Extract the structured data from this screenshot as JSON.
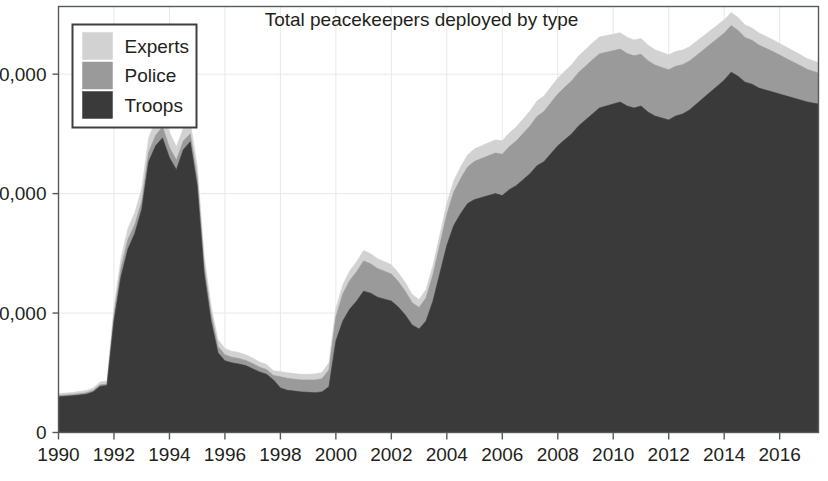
{
  "chart_data": {
    "type": "area",
    "stacked": true,
    "title": "Total peacekeepers deployed by type",
    "xlabel": "",
    "ylabel": "",
    "xlim": [
      1990,
      2017.4
    ],
    "ylim": [
      0,
      107000
    ],
    "grid": true,
    "grid_axes": "both",
    "legend_position": "top-left",
    "y_ticks": [
      0,
      30000,
      60000,
      90000
    ],
    "y_tick_labels": [
      "0",
      "30,000",
      "60,000",
      "90,000"
    ],
    "x_ticks": [
      1990,
      1992,
      1994,
      1996,
      1998,
      2000,
      2002,
      2004,
      2006,
      2008,
      2010,
      2012,
      2014,
      2016
    ],
    "x_tick_labels": [
      "1990",
      "1992",
      "1994",
      "1996",
      "1998",
      "2000",
      "2002",
      "2004",
      "2006",
      "2008",
      "2010",
      "2012",
      "2014",
      "2016"
    ],
    "colors": {
      "Troops": "#3a3a3a",
      "Police": "#9a9a9a",
      "Experts": "#d2d2d2",
      "frame": "#55595c",
      "grid": "#e8e8e8",
      "text": "#231f20",
      "background": "#ffffff"
    },
    "series_order_bottom_to_top": [
      "Troops",
      "Police",
      "Experts"
    ],
    "legend_order_top_to_bottom": [
      "Experts",
      "Police",
      "Troops"
    ],
    "x": [
      1990.0,
      1990.25,
      1990.5,
      1990.75,
      1991.0,
      1991.25,
      1991.5,
      1991.75,
      1992.0,
      1992.25,
      1992.5,
      1992.75,
      1993.0,
      1993.25,
      1993.5,
      1993.75,
      1994.0,
      1994.25,
      1994.5,
      1994.75,
      1995.0,
      1995.25,
      1995.5,
      1995.75,
      1996.0,
      1996.25,
      1996.5,
      1996.75,
      1997.0,
      1997.25,
      1997.5,
      1997.75,
      1998.0,
      1998.25,
      1998.5,
      1998.75,
      1999.0,
      1999.25,
      1999.5,
      1999.75,
      2000.0,
      2000.25,
      2000.5,
      2000.75,
      2001.0,
      2001.25,
      2001.5,
      2001.75,
      2002.0,
      2002.25,
      2002.5,
      2002.75,
      2003.0,
      2003.25,
      2003.5,
      2003.75,
      2004.0,
      2004.25,
      2004.5,
      2004.75,
      2005.0,
      2005.25,
      2005.5,
      2005.75,
      2006.0,
      2006.25,
      2006.5,
      2006.75,
      2007.0,
      2007.25,
      2007.5,
      2007.75,
      2008.0,
      2008.25,
      2008.5,
      2008.75,
      2009.0,
      2009.25,
      2009.5,
      2009.75,
      2010.0,
      2010.25,
      2010.5,
      2010.75,
      2011.0,
      2011.25,
      2011.5,
      2011.75,
      2012.0,
      2012.25,
      2012.5,
      2012.75,
      2013.0,
      2013.25,
      2013.5,
      2013.75,
      2014.0,
      2014.25,
      2014.5,
      2014.75,
      2015.0,
      2015.25,
      2015.5,
      2015.75,
      2016.0,
      2016.25,
      2016.5,
      2016.75,
      2017.0,
      2017.4
    ],
    "series": [
      {
        "name": "Troops",
        "values": [
          9000,
          9100,
          9200,
          9400,
          9600,
          10200,
          11600,
          11800,
          28000,
          39000,
          46000,
          50000,
          56000,
          68000,
          72000,
          74000,
          69000,
          66000,
          71000,
          73000,
          62000,
          40000,
          28000,
          20000,
          18000,
          17500,
          17200,
          16800,
          16000,
          15200,
          14600,
          13200,
          11200,
          10600,
          10400,
          10200,
          10100,
          10000,
          10200,
          11500,
          23000,
          28000,
          31000,
          33000,
          35500,
          35000,
          34000,
          33500,
          33000,
          31500,
          29500,
          27000,
          26000,
          28000,
          33000,
          40000,
          47000,
          52000,
          55000,
          57500,
          58500,
          59000,
          59500,
          60000,
          59500,
          61000,
          62000,
          63500,
          65000,
          67000,
          68000,
          70000,
          72000,
          73500,
          75000,
          77000,
          78500,
          80000,
          81500,
          82000,
          82500,
          83000,
          82000,
          81500,
          82000,
          80500,
          79500,
          79000,
          78500,
          79500,
          80000,
          81000,
          82500,
          84000,
          85500,
          87000,
          88500,
          90500,
          89500,
          88000,
          87500,
          86500,
          86000,
          85500,
          85000,
          84500,
          84000,
          83500,
          83000,
          82500
        ]
      },
      {
        "name": "Police",
        "values": [
          300,
          300,
          320,
          340,
          360,
          380,
          400,
          420,
          1600,
          2200,
          2400,
          2200,
          2000,
          2400,
          2600,
          2800,
          2600,
          2400,
          2200,
          2000,
          2200,
          2000,
          1800,
          1600,
          1500,
          1400,
          1400,
          1300,
          1300,
          1200,
          1200,
          1100,
          2800,
          3000,
          3000,
          3000,
          3100,
          3200,
          3300,
          4200,
          6000,
          6800,
          7200,
          7400,
          7600,
          7400,
          7200,
          7000,
          6800,
          6400,
          6000,
          5600,
          5400,
          5800,
          6600,
          7200,
          7800,
          8400,
          8800,
          9200,
          9600,
          9800,
          10000,
          10200,
          10400,
          10800,
          11200,
          11600,
          12000,
          12400,
          12600,
          12800,
          13000,
          13200,
          13300,
          13400,
          13500,
          13600,
          13600,
          13500,
          13400,
          13300,
          13200,
          13100,
          13000,
          12900,
          12800,
          12700,
          12600,
          12500,
          12400,
          12300,
          12200,
          12100,
          12000,
          11900,
          11800,
          11700,
          11500,
          11200,
          11000,
          10800,
          10500,
          10200,
          9800,
          9400,
          9000,
          8600,
          8200,
          7800
        ]
      },
      {
        "name": "Experts",
        "values": [
          500,
          500,
          520,
          540,
          560,
          600,
          700,
          750,
          1800,
          2400,
          2800,
          3000,
          3200,
          3600,
          3800,
          4000,
          3800,
          3400,
          3200,
          3000,
          2800,
          2400,
          2000,
          1700,
          1600,
          1500,
          1500,
          1400,
          1400,
          1300,
          1300,
          1200,
          1300,
          1400,
          1400,
          1400,
          1450,
          1500,
          1550,
          1800,
          2100,
          2300,
          2400,
          2500,
          2600,
          2500,
          2450,
          2400,
          2350,
          2250,
          2150,
          2050,
          2000,
          2100,
          2300,
          2500,
          2700,
          2850,
          2950,
          3050,
          3150,
          3200,
          3250,
          3300,
          3350,
          3450,
          3550,
          3650,
          3750,
          3850,
          3900,
          3950,
          4000,
          4050,
          4100,
          4150,
          4200,
          4250,
          4250,
          4200,
          4150,
          4100,
          4050,
          4000,
          3950,
          3900,
          3850,
          3800,
          3750,
          3700,
          3650,
          3600,
          3550,
          3500,
          3450,
          3400,
          3350,
          3300,
          3250,
          3150,
          3100,
          3050,
          3000,
          2950,
          2900,
          2850,
          2800,
          2750,
          2700,
          2650
        ]
      }
    ]
  },
  "legend": {
    "items": [
      {
        "label": "Experts",
        "color": "#d2d2d2"
      },
      {
        "label": "Police",
        "color": "#9a9a9a"
      },
      {
        "label": "Troops",
        "color": "#3a3a3a"
      }
    ]
  }
}
